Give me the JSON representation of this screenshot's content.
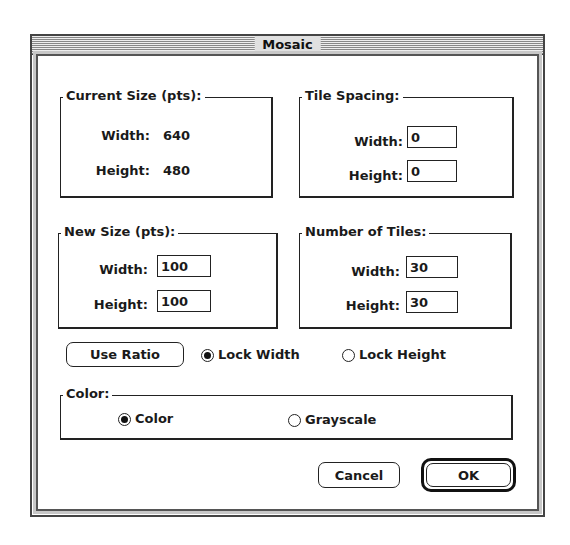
{
  "window": {
    "title": "Mosaic"
  },
  "current_size": {
    "label": "Current Size (pts):",
    "width_label": "Width:",
    "width_value": "640",
    "height_label": "Height:",
    "height_value": "480"
  },
  "tile_spacing": {
    "label": "Tile Spacing:",
    "width_label": "Width:",
    "width_value": "0",
    "height_label": "Height:",
    "height_value": "0"
  },
  "new_size": {
    "label": "New Size (pts):",
    "width_label": "Width:",
    "width_value": "100",
    "height_label": "Height:",
    "height_value": "100"
  },
  "number_of_tiles": {
    "label": "Number of Tiles:",
    "width_label": "Width:",
    "width_value": "30",
    "height_label": "Height:",
    "height_value": "30"
  },
  "ratio": {
    "use_ratio_label": "Use Ratio",
    "lock_width_label": "Lock Width",
    "lock_width_selected": true,
    "lock_height_label": "Lock Height",
    "lock_height_selected": false
  },
  "color": {
    "label": "Color:",
    "color_option_label": "Color",
    "color_selected": true,
    "grayscale_option_label": "Grayscale",
    "grayscale_selected": false
  },
  "buttons": {
    "cancel": "Cancel",
    "ok": "OK"
  }
}
